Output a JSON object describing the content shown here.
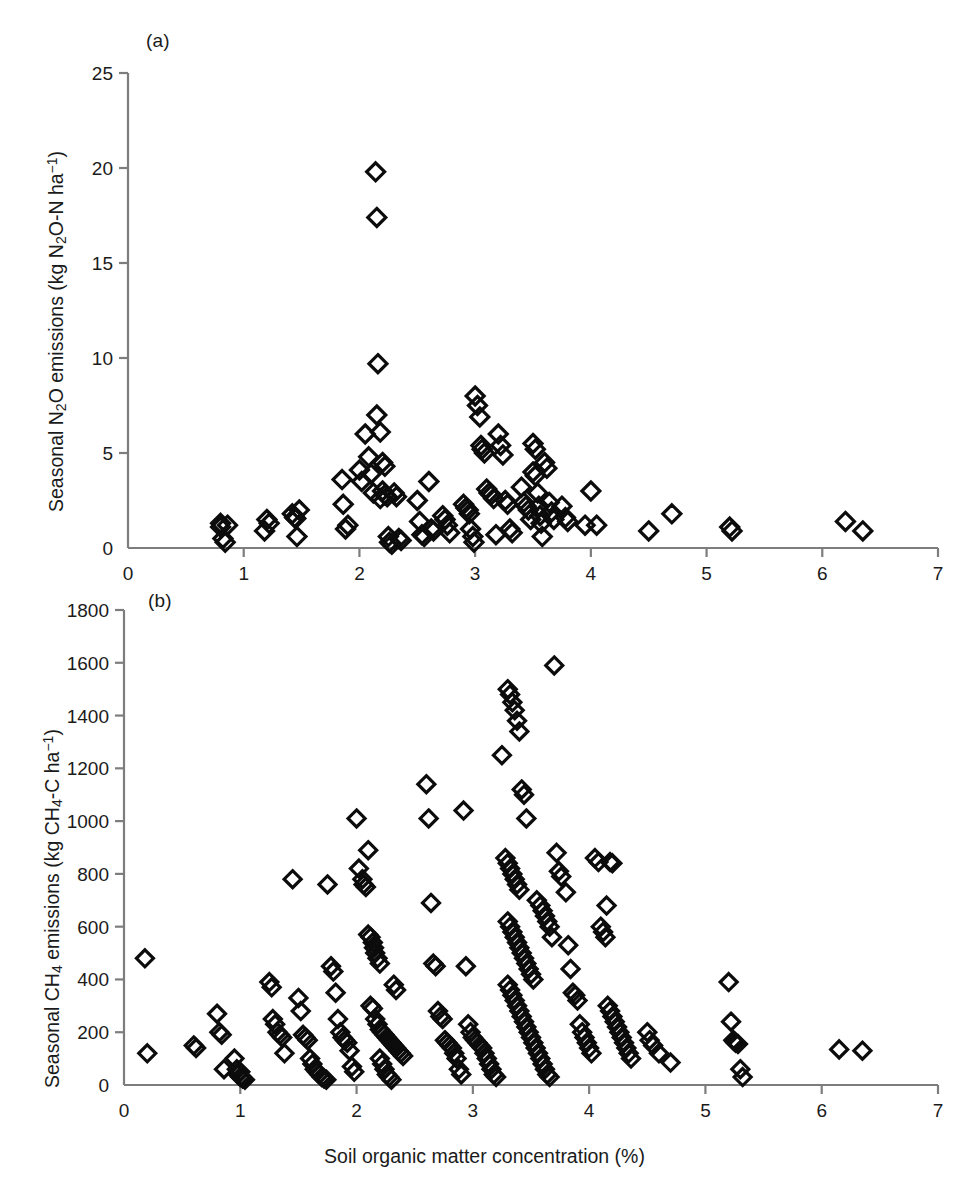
{
  "figure": {
    "panel_a_letter": "(a)",
    "panel_b_letter": "(b)",
    "xlabel": "Soil organic matter concentration (%)",
    "ylabel_a_plain": "Seasonal N2O emissions (kg N2O-N ha-1)",
    "ylabel_b_plain": "Seasonal CH4 emissions (kg CH4-C ha-1)",
    "caption_fragment": ""
  },
  "chart_data": [
    {
      "type": "scatter",
      "panel": "(a)",
      "title": "",
      "xlabel": "Soil organic matter concentration (%)",
      "ylabel": "Seasonal N2O emissions (kg N2O-N ha-1)",
      "xlim": [
        0,
        7
      ],
      "ylim": [
        0,
        25
      ],
      "xticks": [
        0,
        1,
        2,
        3,
        4,
        5,
        6,
        7
      ],
      "yticks": [
        0,
        5,
        10,
        15,
        20,
        25
      ],
      "grid": false,
      "legend": false,
      "marker": "open-diamond",
      "marker_color": "#0c0c0c",
      "points": [
        [
          0.8,
          1.3
        ],
        [
          0.8,
          1.1
        ],
        [
          0.82,
          0.5
        ],
        [
          0.84,
          0.3
        ],
        [
          0.86,
          1.2
        ],
        [
          1.18,
          0.9
        ],
        [
          1.2,
          1.5
        ],
        [
          1.22,
          1.3
        ],
        [
          1.42,
          1.8
        ],
        [
          1.44,
          1.6
        ],
        [
          1.45,
          1.55
        ],
        [
          1.46,
          0.6
        ],
        [
          1.48,
          2.0
        ],
        [
          1.85,
          3.6
        ],
        [
          1.86,
          2.3
        ],
        [
          1.88,
          1.0
        ],
        [
          1.9,
          1.2
        ],
        [
          2.0,
          4.1
        ],
        [
          2.02,
          3.5
        ],
        [
          2.05,
          6.0
        ],
        [
          2.08,
          4.8
        ],
        [
          2.1,
          3.9
        ],
        [
          2.12,
          2.9
        ],
        [
          2.14,
          19.8
        ],
        [
          2.15,
          17.4
        ],
        [
          2.16,
          9.7
        ],
        [
          2.18,
          2.6
        ],
        [
          2.2,
          3.0
        ],
        [
          2.22,
          2.8
        ],
        [
          2.24,
          2.7
        ],
        [
          2.25,
          0.6
        ],
        [
          2.26,
          0.3
        ],
        [
          2.28,
          0.2
        ],
        [
          2.3,
          2.9
        ],
        [
          2.32,
          2.7
        ],
        [
          2.34,
          0.5
        ],
        [
          2.36,
          0.4
        ],
        [
          2.15,
          7.0
        ],
        [
          2.18,
          6.1
        ],
        [
          2.2,
          4.5
        ],
        [
          2.22,
          4.3
        ],
        [
          2.5,
          2.5
        ],
        [
          2.52,
          1.4
        ],
        [
          2.54,
          0.7
        ],
        [
          2.56,
          0.6
        ],
        [
          2.6,
          3.5
        ],
        [
          2.62,
          1.0
        ],
        [
          2.64,
          0.9
        ],
        [
          2.72,
          1.7
        ],
        [
          2.74,
          1.5
        ],
        [
          2.76,
          1.2
        ],
        [
          2.78,
          0.8
        ],
        [
          2.9,
          2.3
        ],
        [
          2.92,
          2.1
        ],
        [
          2.94,
          2.0
        ],
        [
          2.95,
          1.8
        ],
        [
          2.96,
          1.0
        ],
        [
          2.98,
          0.6
        ],
        [
          2.99,
          0.3
        ],
        [
          3.0,
          8.0
        ],
        [
          3.02,
          7.5
        ],
        [
          3.04,
          6.9
        ],
        [
          3.05,
          5.4
        ],
        [
          3.06,
          5.2
        ],
        [
          3.08,
          5.0
        ],
        [
          3.1,
          3.1
        ],
        [
          3.12,
          2.9
        ],
        [
          3.14,
          2.8
        ],
        [
          3.16,
          2.6
        ],
        [
          3.18,
          0.7
        ],
        [
          3.2,
          6.0
        ],
        [
          3.22,
          5.4
        ],
        [
          3.24,
          4.9
        ],
        [
          3.26,
          2.5
        ],
        [
          3.28,
          2.3
        ],
        [
          3.3,
          1.0
        ],
        [
          3.32,
          0.8
        ],
        [
          3.4,
          3.2
        ],
        [
          3.42,
          2.4
        ],
        [
          3.44,
          2.2
        ],
        [
          3.46,
          2.0
        ],
        [
          3.48,
          1.5
        ],
        [
          3.5,
          4.0
        ],
        [
          3.52,
          3.8
        ],
        [
          3.54,
          2.9
        ],
        [
          3.55,
          2.2
        ],
        [
          3.56,
          1.7
        ],
        [
          3.57,
          1.3
        ],
        [
          3.58,
          0.6
        ],
        [
          3.5,
          5.5
        ],
        [
          3.52,
          5.2
        ],
        [
          3.6,
          4.5
        ],
        [
          3.62,
          4.2
        ],
        [
          3.64,
          2.4
        ],
        [
          3.66,
          1.9
        ],
        [
          3.68,
          1.5
        ],
        [
          3.75,
          2.2
        ],
        [
          3.78,
          1.6
        ],
        [
          3.8,
          1.4
        ],
        [
          3.95,
          1.2
        ],
        [
          4.0,
          3.0
        ],
        [
          4.05,
          1.2
        ],
        [
          4.5,
          0.9
        ],
        [
          4.7,
          1.8
        ],
        [
          5.2,
          1.1
        ],
        [
          5.22,
          0.9
        ],
        [
          6.2,
          1.4
        ],
        [
          6.35,
          0.9
        ]
      ]
    },
    {
      "type": "scatter",
      "panel": "(b)",
      "title": "",
      "xlabel": "Soil organic matter concentration (%)",
      "ylabel": "Seasonal CH4 emissions (kg CH4-C ha-1)",
      "xlim": [
        0,
        7
      ],
      "ylim": [
        0,
        1800
      ],
      "xticks": [
        0,
        1,
        2,
        3,
        4,
        5,
        6,
        7
      ],
      "yticks": [
        0,
        200,
        400,
        600,
        800,
        1000,
        1200,
        1400,
        1600,
        1800
      ],
      "grid": false,
      "legend": false,
      "marker": "open-diamond",
      "marker_color": "#0c0c0c",
      "points": [
        [
          0.18,
          480
        ],
        [
          0.2,
          120
        ],
        [
          0.6,
          150
        ],
        [
          0.62,
          140
        ],
        [
          0.8,
          270
        ],
        [
          0.82,
          200
        ],
        [
          0.84,
          190
        ],
        [
          0.86,
          60
        ],
        [
          0.95,
          100
        ],
        [
          0.97,
          60
        ],
        [
          0.98,
          40
        ],
        [
          1.0,
          30
        ],
        [
          1.02,
          25
        ],
        [
          1.04,
          20
        ],
        [
          1.0,
          50
        ],
        [
          1.25,
          390
        ],
        [
          1.27,
          370
        ],
        [
          1.28,
          250
        ],
        [
          1.3,
          230
        ],
        [
          1.32,
          200
        ],
        [
          1.34,
          190
        ],
        [
          1.36,
          180
        ],
        [
          1.38,
          120
        ],
        [
          1.45,
          780
        ],
        [
          1.5,
          330
        ],
        [
          1.52,
          280
        ],
        [
          1.54,
          190
        ],
        [
          1.56,
          180
        ],
        [
          1.58,
          170
        ],
        [
          1.6,
          100
        ],
        [
          1.62,
          80
        ],
        [
          1.64,
          60
        ],
        [
          1.66,
          50
        ],
        [
          1.68,
          40
        ],
        [
          1.7,
          30
        ],
        [
          1.72,
          25
        ],
        [
          1.74,
          20
        ],
        [
          1.75,
          760
        ],
        [
          1.78,
          450
        ],
        [
          1.8,
          430
        ],
        [
          1.82,
          350
        ],
        [
          1.84,
          250
        ],
        [
          1.86,
          200
        ],
        [
          1.88,
          180
        ],
        [
          1.9,
          170
        ],
        [
          1.92,
          160
        ],
        [
          1.94,
          130
        ],
        [
          1.96,
          70
        ],
        [
          1.98,
          50
        ],
        [
          2.0,
          1010
        ],
        [
          2.02,
          820
        ],
        [
          2.05,
          780
        ],
        [
          2.06,
          760
        ],
        [
          2.08,
          750
        ],
        [
          2.1,
          890
        ],
        [
          2.12,
          560
        ],
        [
          2.14,
          540
        ],
        [
          2.15,
          520
        ],
        [
          2.16,
          500
        ],
        [
          2.18,
          480
        ],
        [
          2.2,
          460
        ],
        [
          2.1,
          570
        ],
        [
          2.12,
          300
        ],
        [
          2.14,
          290
        ],
        [
          2.16,
          250
        ],
        [
          2.18,
          230
        ],
        [
          2.2,
          210
        ],
        [
          2.22,
          200
        ],
        [
          2.24,
          190
        ],
        [
          2.26,
          180
        ],
        [
          2.28,
          170
        ],
        [
          2.3,
          160
        ],
        [
          2.32,
          150
        ],
        [
          2.34,
          140
        ],
        [
          2.36,
          130
        ],
        [
          2.38,
          120
        ],
        [
          2.4,
          110
        ],
        [
          2.2,
          100
        ],
        [
          2.22,
          80
        ],
        [
          2.24,
          60
        ],
        [
          2.26,
          40
        ],
        [
          2.28,
          30
        ],
        [
          2.3,
          20
        ],
        [
          2.32,
          380
        ],
        [
          2.34,
          360
        ],
        [
          2.6,
          1140
        ],
        [
          2.62,
          1010
        ],
        [
          2.64,
          690
        ],
        [
          2.66,
          460
        ],
        [
          2.68,
          450
        ],
        [
          2.7,
          280
        ],
        [
          2.72,
          260
        ],
        [
          2.74,
          250
        ],
        [
          2.76,
          170
        ],
        [
          2.78,
          160
        ],
        [
          2.8,
          150
        ],
        [
          2.82,
          140
        ],
        [
          2.84,
          120
        ],
        [
          2.86,
          100
        ],
        [
          2.88,
          60
        ],
        [
          2.9,
          40
        ],
        [
          2.92,
          1040
        ],
        [
          2.94,
          450
        ],
        [
          2.96,
          230
        ],
        [
          2.98,
          200
        ],
        [
          3.0,
          180
        ],
        [
          3.02,
          170
        ],
        [
          3.04,
          160
        ],
        [
          3.06,
          150
        ],
        [
          3.08,
          140
        ],
        [
          3.1,
          120
        ],
        [
          3.12,
          100
        ],
        [
          3.14,
          80
        ],
        [
          3.16,
          60
        ],
        [
          3.18,
          40
        ],
        [
          3.2,
          30
        ],
        [
          3.25,
          1250
        ],
        [
          3.28,
          860
        ],
        [
          3.3,
          840
        ],
        [
          3.32,
          820
        ],
        [
          3.34,
          800
        ],
        [
          3.36,
          780
        ],
        [
          3.38,
          760
        ],
        [
          3.4,
          740
        ],
        [
          3.3,
          1500
        ],
        [
          3.32,
          1480
        ],
        [
          3.34,
          1450
        ],
        [
          3.36,
          1420
        ],
        [
          3.38,
          1380
        ],
        [
          3.4,
          1340
        ],
        [
          3.42,
          1120
        ],
        [
          3.44,
          1100
        ],
        [
          3.46,
          1010
        ],
        [
          3.3,
          620
        ],
        [
          3.32,
          600
        ],
        [
          3.34,
          580
        ],
        [
          3.36,
          560
        ],
        [
          3.38,
          540
        ],
        [
          3.4,
          520
        ],
        [
          3.42,
          500
        ],
        [
          3.44,
          480
        ],
        [
          3.46,
          460
        ],
        [
          3.48,
          440
        ],
        [
          3.5,
          420
        ],
        [
          3.52,
          400
        ],
        [
          3.3,
          380
        ],
        [
          3.32,
          360
        ],
        [
          3.34,
          340
        ],
        [
          3.36,
          320
        ],
        [
          3.38,
          300
        ],
        [
          3.4,
          280
        ],
        [
          3.42,
          260
        ],
        [
          3.44,
          240
        ],
        [
          3.46,
          220
        ],
        [
          3.48,
          200
        ],
        [
          3.5,
          180
        ],
        [
          3.52,
          160
        ],
        [
          3.54,
          140
        ],
        [
          3.56,
          120
        ],
        [
          3.58,
          100
        ],
        [
          3.6,
          80
        ],
        [
          3.62,
          60
        ],
        [
          3.64,
          40
        ],
        [
          3.66,
          30
        ],
        [
          3.55,
          700
        ],
        [
          3.58,
          680
        ],
        [
          3.6,
          660
        ],
        [
          3.62,
          640
        ],
        [
          3.64,
          620
        ],
        [
          3.66,
          600
        ],
        [
          3.68,
          560
        ],
        [
          3.7,
          1590
        ],
        [
          3.72,
          880
        ],
        [
          3.74,
          810
        ],
        [
          3.76,
          790
        ],
        [
          3.8,
          730
        ],
        [
          3.82,
          530
        ],
        [
          3.84,
          440
        ],
        [
          3.86,
          350
        ],
        [
          3.88,
          340
        ],
        [
          3.9,
          320
        ],
        [
          3.92,
          230
        ],
        [
          3.94,
          200
        ],
        [
          3.96,
          180
        ],
        [
          3.98,
          160
        ],
        [
          4.0,
          140
        ],
        [
          4.02,
          120
        ],
        [
          4.05,
          860
        ],
        [
          4.08,
          845
        ],
        [
          4.1,
          600
        ],
        [
          4.12,
          580
        ],
        [
          4.14,
          560
        ],
        [
          4.16,
          300
        ],
        [
          4.18,
          280
        ],
        [
          4.2,
          260
        ],
        [
          4.22,
          240
        ],
        [
          4.24,
          220
        ],
        [
          4.26,
          200
        ],
        [
          4.28,
          180
        ],
        [
          4.3,
          160
        ],
        [
          4.32,
          140
        ],
        [
          4.34,
          120
        ],
        [
          4.36,
          100
        ],
        [
          4.15,
          680
        ],
        [
          4.18,
          845
        ],
        [
          4.2,
          840
        ],
        [
          4.5,
          200
        ],
        [
          4.52,
          170
        ],
        [
          4.55,
          150
        ],
        [
          4.6,
          120
        ],
        [
          4.7,
          85
        ],
        [
          5.2,
          390
        ],
        [
          5.22,
          240
        ],
        [
          5.24,
          170
        ],
        [
          5.25,
          165
        ],
        [
          5.26,
          160
        ],
        [
          5.28,
          155
        ],
        [
          5.3,
          60
        ],
        [
          5.32,
          30
        ],
        [
          6.15,
          135
        ],
        [
          6.35,
          130
        ]
      ]
    }
  ]
}
